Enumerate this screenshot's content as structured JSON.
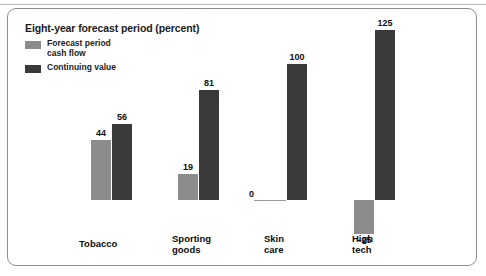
{
  "frame": {
    "title": "Eight-year forecast period (percent)"
  },
  "legend": {
    "items": [
      {
        "label": "Forecast period\ncash flow",
        "color": "#8c8c8c",
        "name": "legend-forecast-period-cash-flow"
      },
      {
        "label": "Continuing value",
        "color": "#3a3a3a",
        "name": "legend-continuing-value"
      }
    ]
  },
  "chart_data": {
    "type": "bar",
    "title": "Eight-year forecast period (percent)",
    "xlabel": "",
    "ylabel": "",
    "ylim": [
      -25,
      125
    ],
    "grid": false,
    "legend_position": "top-left",
    "categories": [
      "Tobacco",
      "Sporting goods",
      "Skin care",
      "High tech"
    ],
    "category_labels": [
      "Tobacco",
      "Sporting\ngoods",
      "Skin\ncare",
      "High\ntech"
    ],
    "series": [
      {
        "name": "Forecast period cash flow",
        "color": "#8c8c8c",
        "values": [
          44,
          19,
          0,
          -25
        ]
      },
      {
        "name": "Continuing value",
        "color": "#3a3a3a",
        "values": [
          56,
          81,
          100,
          125
        ]
      }
    ],
    "data_labels": {
      "Tobacco": {
        "forecast": "44",
        "continuing": "56"
      },
      "Sporting goods": {
        "forecast": "19",
        "continuing": "81"
      },
      "Skin care": {
        "forecast": "0",
        "continuing": "100"
      },
      "High tech": {
        "forecast": "–25",
        "continuing": "125"
      }
    }
  },
  "geometry": {
    "baseline_y": 200,
    "px_per_unit": 1.36,
    "bar_width": 20,
    "groups": [
      {
        "key": "Tobacco",
        "forecast_x": 91,
        "continuing_x": 112,
        "label_x": 79,
        "label_y": 238
      },
      {
        "key": "Sporting goods",
        "forecast_x": 178,
        "continuing_x": 199,
        "label_x": 172,
        "label_y": 233
      },
      {
        "key": "Skin care",
        "forecast_x": 266,
        "continuing_x": 287,
        "label_x": 264,
        "label_y": 233
      },
      {
        "key": "High tech",
        "forecast_x": 354,
        "continuing_x": 375,
        "label_x": 352,
        "label_y": 233
      }
    ]
  }
}
